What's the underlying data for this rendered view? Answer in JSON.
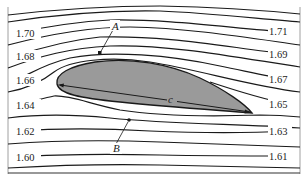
{
  "figure": {
    "type": "streamline diagram around airfoil",
    "airfoil": {
      "fill_color": "#9a9a9a",
      "leading_edge_point": "leading-edge",
      "trailing_edge_point": "trailing-edge",
      "chord_label": "c"
    },
    "point_labels": {
      "upper": "A",
      "lower": "B"
    },
    "left_labels": [
      "1.70",
      "1.68",
      "1.66",
      "1.64",
      "1.62",
      "1.60"
    ],
    "right_labels": [
      "1.71",
      "1.69",
      "1.67",
      "1.65",
      "1.63",
      "1.61"
    ],
    "colors": {
      "line": "#1a1a1a",
      "airfoil": "#9a9a9a",
      "background": "#ffffff"
    }
  }
}
